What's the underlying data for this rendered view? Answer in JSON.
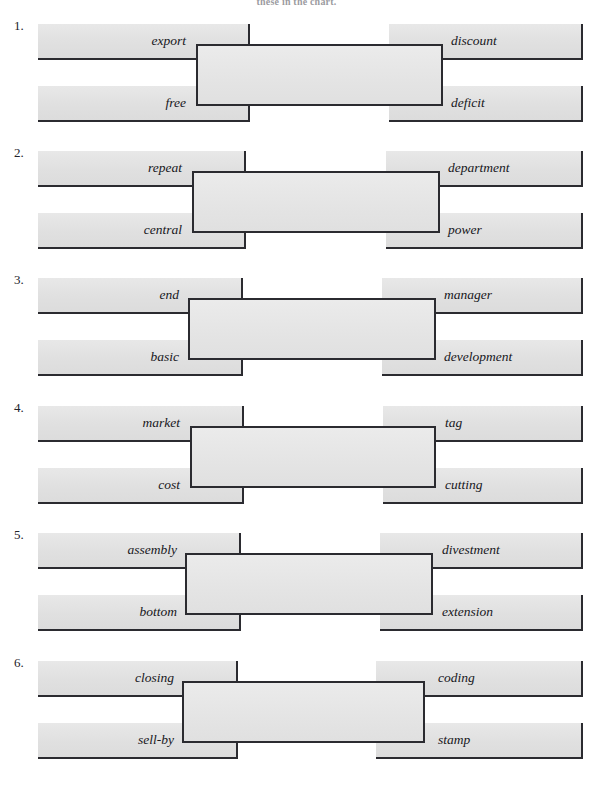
{
  "page": {
    "header_text": "these in the chart.",
    "title": "Compound word matching worksheet"
  },
  "exercises": [
    {
      "number": "1.",
      "left_top": "export",
      "left_bottom": "free",
      "answer": "",
      "right_top": "discount",
      "right_bottom": "deficit"
    },
    {
      "number": "2.",
      "left_top": "repeat",
      "left_bottom": "central",
      "answer": "",
      "right_top": "department",
      "right_bottom": "power"
    },
    {
      "number": "3.",
      "left_top": "end",
      "left_bottom": "basic",
      "answer": "",
      "right_top": "manager",
      "right_bottom": "development"
    },
    {
      "number": "4.",
      "left_top": "market",
      "left_bottom": "cost",
      "answer": "",
      "right_top": "tag",
      "right_bottom": "cutting"
    },
    {
      "number": "5.",
      "left_top": "assembly",
      "left_bottom": "bottom",
      "answer": "",
      "right_top": "divestment",
      "right_bottom": "extension"
    },
    {
      "number": "6.",
      "left_top": "closing",
      "left_bottom": "sell-by",
      "answer": "",
      "right_top": "coding",
      "right_bottom": "stamp"
    }
  ],
  "colors": {
    "paper": "#ffffff",
    "bar_fill": "#e4e4e4",
    "ink": "#2b2b30",
    "text": "#17171c"
  }
}
